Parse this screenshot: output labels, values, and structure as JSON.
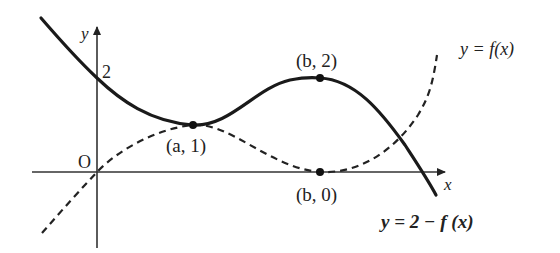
{
  "diagram": {
    "axes": {
      "x_label": "x",
      "y_label": "y",
      "origin_label": "O",
      "y_tick_label": "2"
    },
    "curves": [
      {
        "name": "f",
        "label": "y = f(x)",
        "style": "dashed"
      },
      {
        "name": "g",
        "label": "y = 2 − f (x)",
        "style": "solid-bold"
      }
    ],
    "points": [
      {
        "label": "(a, 1)",
        "description": "intersection / tangency of both curves"
      },
      {
        "label": "(b, 2)",
        "description": "local maximum of y = 2 - f(x)"
      },
      {
        "label": "(b, 0)",
        "description": "local minimum of y = f(x) on x-axis"
      }
    ],
    "colors": {
      "stroke": "#222222",
      "background": "#ffffff"
    }
  }
}
